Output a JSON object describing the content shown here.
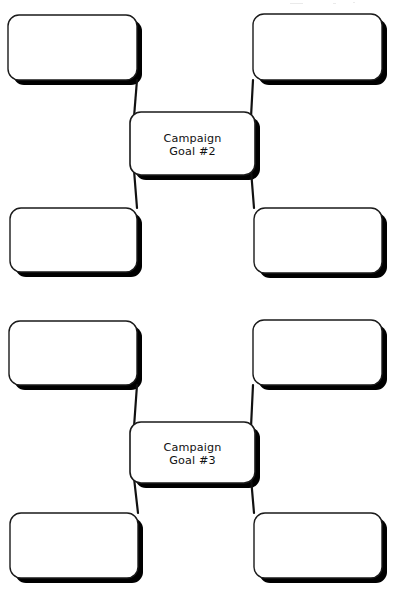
{
  "page": {
    "background_color": "#ffffff",
    "width": 394,
    "height": 594
  },
  "style": {
    "box_fill": "#ffffff",
    "box_stroke": "#1a1a1a",
    "box_stroke_width": 1.4,
    "center_stroke_width": 1.6,
    "shadow_color": "#000000",
    "shadow_offset_x": 5,
    "shadow_offset_y": 5,
    "connector_color": "#111111",
    "connector_width": 2.2,
    "corner_radius": 11,
    "text_color": "#111111"
  },
  "diagrams": [
    {
      "id": "campaign-goal-2",
      "center": {
        "label_line_1": "Campaign",
        "label_line_2": "Goal #2",
        "x": 130,
        "y": 112,
        "width": 125,
        "height": 63
      },
      "branches": [
        {
          "position": "top-left",
          "label": "",
          "x": 8,
          "y": 15,
          "width": 129,
          "height": 65
        },
        {
          "position": "top-right",
          "label": "",
          "x": 253,
          "y": 14,
          "width": 129,
          "height": 66
        },
        {
          "position": "bottom-left",
          "label": "",
          "x": 10,
          "y": 208,
          "width": 127,
          "height": 64
        },
        {
          "position": "bottom-right",
          "label": "",
          "x": 254,
          "y": 208,
          "width": 128,
          "height": 65
        }
      ],
      "connectors": [
        {
          "from": "top-left",
          "x1": 137,
          "y1": 80,
          "x2": 134,
          "y2": 117
        },
        {
          "from": "top-right",
          "x1": 253,
          "y1": 80,
          "x2": 251,
          "y2": 117
        },
        {
          "from": "bottom-left",
          "x1": 134,
          "y1": 170,
          "x2": 137,
          "y2": 208
        },
        {
          "from": "bottom-right",
          "x1": 251,
          "y1": 170,
          "x2": 254,
          "y2": 208
        }
      ]
    },
    {
      "id": "campaign-goal-3",
      "center": {
        "label_line_1": "Campaign",
        "label_line_2": "Goal #3",
        "x": 130,
        "y": 422,
        "width": 125,
        "height": 61
      },
      "branches": [
        {
          "position": "top-left",
          "label": "",
          "x": 9,
          "y": 321,
          "width": 128,
          "height": 64
        },
        {
          "position": "top-right",
          "label": "",
          "x": 253,
          "y": 320,
          "width": 129,
          "height": 65
        },
        {
          "position": "bottom-left",
          "label": "",
          "x": 10,
          "y": 513,
          "width": 128,
          "height": 65
        },
        {
          "position": "bottom-right",
          "label": "",
          "x": 254,
          "y": 513,
          "width": 128,
          "height": 65
        }
      ],
      "connectors": [
        {
          "from": "top-left",
          "x1": 137,
          "y1": 385,
          "x2": 134,
          "y2": 427
        },
        {
          "from": "top-right",
          "x1": 253,
          "y1": 385,
          "x2": 251,
          "y2": 427
        },
        {
          "from": "bottom-left",
          "x1": 134,
          "y1": 478,
          "x2": 138,
          "y2": 513
        },
        {
          "from": "bottom-right",
          "x1": 251,
          "y1": 478,
          "x2": 254,
          "y2": 513
        }
      ]
    }
  ]
}
